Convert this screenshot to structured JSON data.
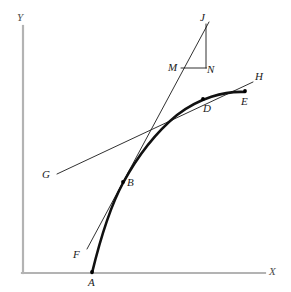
{
  "figure": {
    "width": 291,
    "height": 292,
    "background": "#ffffff"
  },
  "colors": {
    "axis": "#b3b3b3",
    "axis_label": "#4d4d4d",
    "curve": "#111111",
    "line": "#1a1a1a",
    "point": "#000000",
    "text": "#1a1a1a"
  },
  "axes": {
    "x": {
      "label": "X",
      "label_x": 269,
      "label_y": 268,
      "start_x": 23,
      "start_y": 273,
      "end_x": 265,
      "end_y": 273
    },
    "y": {
      "label": "Y",
      "label_x": 17,
      "label_y": 12,
      "start_x": 23,
      "start_y": 273,
      "end_x": 23,
      "end_y": 26
    }
  },
  "curve": {
    "name": "main-curve",
    "from": "A",
    "to": "E",
    "path": "M 92,273 C 101,236 111,205 123,183 C 136,159 154,134 177,115 C 199,98 224,91 245,92",
    "stroke_width": 2.6
  },
  "lines": [
    {
      "name": "tangent-line-FJ",
      "from": "F",
      "to": "J",
      "x1": 87,
      "y1": 249,
      "x2": 209,
      "y2": 22,
      "stroke_width": 0.9,
      "description": "tangent to the curve at point B, passing through M"
    },
    {
      "name": "secant-line-GH",
      "from": "G",
      "to": "H",
      "x1": 57,
      "y1": 174,
      "x2": 253,
      "y2": 82,
      "stroke_width": 0.9,
      "description": "secant line passing through point D"
    },
    {
      "name": "triangle-leg-JN",
      "from": "J",
      "to": "N",
      "x1": 206,
      "y1": 24,
      "x2": 206,
      "y2": 68,
      "stroke_width": 0.9,
      "description": "vertical rise leg of slope triangle"
    },
    {
      "name": "triangle-leg-MN",
      "from": "M",
      "to": "N",
      "x1": 181,
      "y1": 68,
      "x2": 206,
      "y2": 68,
      "stroke_width": 0.9,
      "description": "horizontal run leg of slope triangle"
    }
  ],
  "points": [
    {
      "id": "A",
      "label": "A",
      "dot": true,
      "x": 92,
      "y": 273,
      "label_x": 88,
      "label_y": 277
    },
    {
      "id": "B",
      "label": "B",
      "dot": true,
      "x": 123,
      "y": 182,
      "label_x": 127,
      "label_y": 178
    },
    {
      "id": "D",
      "label": "D",
      "dot": true,
      "x": 203,
      "y": 99,
      "label_x": 203,
      "label_y": 103
    },
    {
      "id": "E",
      "label": "E",
      "dot": true,
      "x": 245,
      "y": 92,
      "label_x": 241,
      "label_y": 96
    },
    {
      "id": "F",
      "label": "F",
      "dot": false,
      "x": 87,
      "y": 249,
      "label_x": 76,
      "label_y": 250
    },
    {
      "id": "G",
      "label": "G",
      "dot": false,
      "x": 57,
      "y": 174,
      "label_x": 43,
      "label_y": 170
    },
    {
      "id": "H",
      "label": "H",
      "dot": false,
      "x": 253,
      "y": 82,
      "label_x": 255,
      "label_y": 72
    },
    {
      "id": "J",
      "label": "J",
      "dot": false,
      "x": 208,
      "y": 23,
      "label_x": 200,
      "label_y": 13
    },
    {
      "id": "M",
      "label": "M",
      "dot": false,
      "x": 181,
      "y": 68,
      "label_x": 169,
      "label_y": 63
    },
    {
      "id": "N",
      "label": "N",
      "dot": false,
      "x": 206,
      "y": 68,
      "label_x": 207,
      "label_y": 65
    }
  ]
}
